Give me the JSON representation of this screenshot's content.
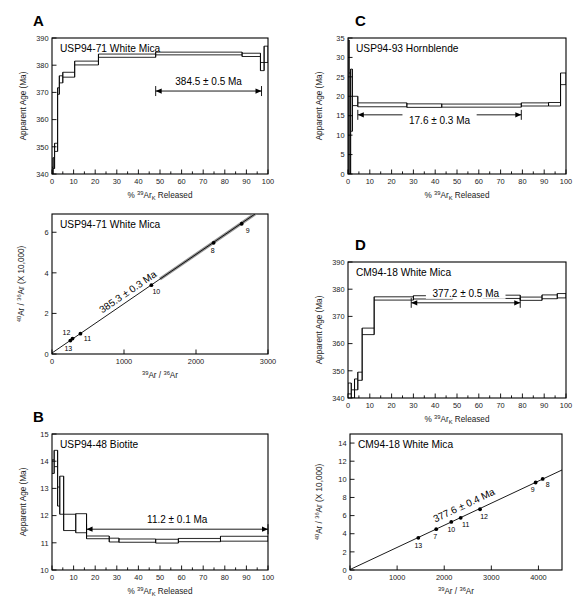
{
  "figure": {
    "panels": [
      "A",
      "B",
      "C",
      "D"
    ]
  },
  "axis_titles": {
    "spectrum_y": "Apparent Age (Ma)",
    "spectrum_x_pre": "% ",
    "spectrum_x_sup": "39",
    "spectrum_x_el": "Ar",
    "spectrum_x_sub": "K",
    "spectrum_x_post": " Released",
    "isochron_y_sup1": "40",
    "isochron_y_el1": "Ar",
    "isochron_y_slash": " / ",
    "isochron_y_sup2": "36",
    "isochron_y_el2": "Ar",
    "isochron_y_mult": " (X 10,000)",
    "isochron_x_sup1": "39",
    "isochron_x_el1": "Ar",
    "isochron_x_slash": " / ",
    "isochron_x_sup2": "36",
    "isochron_x_el2": "Ar"
  },
  "chart_data": [
    {
      "id": "panel-a-spectrum",
      "panel": "A",
      "type": "area",
      "title": "USP94-71   White Mica",
      "sample": "USP94-71",
      "mineral": "White Mica",
      "xlabel": "% 39ArK Released",
      "ylabel": "Apparent Age (Ma)",
      "xlim": [
        0,
        100
      ],
      "ylim": [
        340,
        390
      ],
      "xticks": [
        0,
        10,
        20,
        30,
        40,
        50,
        60,
        70,
        80,
        90,
        100
      ],
      "yticks": [
        340,
        350,
        360,
        370,
        380,
        390
      ],
      "grid": false,
      "plateau_label": "384.5 ± 0.5 Ma",
      "plateau_range": [
        48,
        97
      ],
      "plateau_age": 384.5,
      "plateau_error": 0.5,
      "steps": [
        {
          "x0": 0.0,
          "x1": 0.5,
          "age": 340.5,
          "err": 2.0
        },
        {
          "x0": 0.5,
          "x1": 1.2,
          "age": 344.0,
          "err": 2.0
        },
        {
          "x0": 1.2,
          "x1": 2.6,
          "age": 349.8,
          "err": 1.5
        },
        {
          "x0": 2.6,
          "x1": 3.4,
          "age": 370.5,
          "err": 1.2
        },
        {
          "x0": 3.4,
          "x1": 5.0,
          "age": 374.8,
          "err": 1.3
        },
        {
          "x0": 5.0,
          "x1": 10.5,
          "age": 376.5,
          "err": 0.9
        },
        {
          "x0": 10.5,
          "x1": 21.5,
          "age": 380.8,
          "err": 0.7
        },
        {
          "x0": 21.5,
          "x1": 48.0,
          "age": 383.5,
          "err": 0.6
        },
        {
          "x0": 48.0,
          "x1": 88.0,
          "age": 384.3,
          "err": 0.5
        },
        {
          "x0": 88.0,
          "x1": 96.5,
          "age": 383.8,
          "err": 0.6
        },
        {
          "x0": 96.5,
          "x1": 98.2,
          "age": 379.5,
          "err": 1.5
        },
        {
          "x0": 98.2,
          "x1": 100.0,
          "age": 384.0,
          "err": 3.0
        }
      ]
    },
    {
      "id": "panel-a-isochron",
      "panel": "A",
      "type": "scatter",
      "title": "USP94-71 White Mica",
      "sample": "USP94-71",
      "mineral": "White Mica",
      "xlabel": "39Ar / 36Ar",
      "ylabel": "40Ar / 36Ar (X 10,000)",
      "xlim": [
        0,
        3000
      ],
      "ylim": [
        0,
        6.9
      ],
      "xticks": [
        0,
        1000,
        2000,
        3000
      ],
      "yticks": [
        0,
        2,
        4,
        6
      ],
      "grid": false,
      "age_label": "385.3 ± 0.3 Ma",
      "age": 385.3,
      "age_error": 0.3,
      "intercept": 0.05,
      "slope_per_1000": 2.43,
      "points": [
        {
          "label": "13",
          "x": 255,
          "y": 0.66
        },
        {
          "label": "12",
          "x": 285,
          "y": 0.76
        },
        {
          "label": "11",
          "x": 395,
          "y": 1.0
        },
        {
          "label": "10",
          "x": 1380,
          "y": 3.39
        },
        {
          "label": "8",
          "x": 2245,
          "y": 5.48
        },
        {
          "label": "9",
          "x": 2635,
          "y": 6.42
        }
      ]
    },
    {
      "id": "panel-b-spectrum",
      "panel": "B",
      "type": "area",
      "title": "USP94-48   Biotite",
      "sample": "USP94-48",
      "mineral": "Biotite",
      "xlabel": "% 39ArK Released",
      "ylabel": "Apparent Age (Ma)",
      "xlim": [
        0,
        100
      ],
      "ylim": [
        10,
        15
      ],
      "xticks": [
        0,
        10,
        20,
        30,
        40,
        50,
        60,
        70,
        80,
        90,
        100
      ],
      "yticks": [
        10,
        11,
        12,
        13,
        14,
        15
      ],
      "grid": false,
      "plateau_label": "11.2 ± 0.1 Ma",
      "plateau_range": [
        16,
        100
      ],
      "plateau_age": 11.2,
      "plateau_error": 0.1,
      "steps": [
        {
          "x0": 0.0,
          "x1": 1.0,
          "age": 13.8,
          "err": 0.25
        },
        {
          "x0": 1.0,
          "x1": 2.6,
          "age": 14.1,
          "err": 0.3
        },
        {
          "x0": 2.6,
          "x1": 3.6,
          "age": 12.7,
          "err": 0.35
        },
        {
          "x0": 3.6,
          "x1": 5.4,
          "age": 12.75,
          "err": 0.7
        },
        {
          "x0": 5.4,
          "x1": 11.0,
          "age": 11.75,
          "err": 0.3
        },
        {
          "x0": 11.0,
          "x1": 16.0,
          "age": 11.72,
          "err": 0.35
        },
        {
          "x0": 16.0,
          "x1": 26.5,
          "age": 11.2,
          "err": 0.05
        },
        {
          "x0": 26.5,
          "x1": 31.0,
          "age": 11.1,
          "err": 0.07
        },
        {
          "x0": 31.0,
          "x1": 48.0,
          "age": 11.08,
          "err": 0.06
        },
        {
          "x0": 48.0,
          "x1": 58.5,
          "age": 11.06,
          "err": 0.07
        },
        {
          "x0": 58.5,
          "x1": 78.0,
          "age": 11.1,
          "err": 0.06
        },
        {
          "x0": 78.0,
          "x1": 100.0,
          "age": 11.15,
          "err": 0.09
        }
      ]
    },
    {
      "id": "panel-c-spectrum",
      "panel": "C",
      "type": "area",
      "title": "USP94-93   Hornblende",
      "sample": "USP94-93",
      "mineral": "Hornblende",
      "xlabel": "% 39ArK Released",
      "ylabel": "Apparent Age (Ma)",
      "xlim": [
        0,
        100
      ],
      "ylim": [
        0,
        35
      ],
      "xticks": [
        0,
        10,
        20,
        30,
        40,
        50,
        60,
        70,
        80,
        90,
        100
      ],
      "yticks": [
        0,
        5,
        10,
        15,
        20,
        25,
        30,
        35
      ],
      "grid": false,
      "plateau_label": "17.6 ± 0.3 Ma",
      "plateau_range": [
        4.5,
        79.5
      ],
      "plateau_age": 17.6,
      "plateau_error": 0.3,
      "steps": [
        {
          "x0": 0.0,
          "x1": 0.5,
          "age": 17.0,
          "err": 17.5
        },
        {
          "x0": 0.5,
          "x1": 1.2,
          "age": 13.0,
          "err": 13.0
        },
        {
          "x0": 1.2,
          "x1": 2.0,
          "age": 19.0,
          "err": 8.0
        },
        {
          "x0": 2.0,
          "x1": 4.5,
          "age": 18.8,
          "err": 1.2
        },
        {
          "x0": 4.5,
          "x1": 27.0,
          "age": 17.8,
          "err": 0.5
        },
        {
          "x0": 27.0,
          "x1": 43.0,
          "age": 17.6,
          "err": 0.45
        },
        {
          "x0": 43.0,
          "x1": 79.5,
          "age": 17.6,
          "err": 0.4
        },
        {
          "x0": 79.5,
          "x1": 92.0,
          "age": 17.9,
          "err": 0.4
        },
        {
          "x0": 92.0,
          "x1": 97.5,
          "age": 17.95,
          "err": 0.45
        },
        {
          "x0": 97.5,
          "x1": 100.0,
          "age": 24.5,
          "err": 1.5
        }
      ]
    },
    {
      "id": "panel-d-spectrum",
      "panel": "D",
      "type": "area",
      "title": "CM94-18   White Mica",
      "sample": "CM94-18",
      "mineral": "White Mica",
      "xlabel": "% 39ArK Released",
      "ylabel": "Apparent Age (Ma)",
      "xlim": [
        0,
        100
      ],
      "ylim": [
        340,
        390
      ],
      "xticks": [
        0,
        10,
        20,
        30,
        40,
        50,
        60,
        70,
        80,
        90,
        100
      ],
      "yticks": [
        340,
        350,
        360,
        370,
        380,
        390
      ],
      "grid": false,
      "plateau_label": "377.2 ± 0.5 Ma",
      "plateau_range": [
        29,
        79
      ],
      "plateau_age": 377.2,
      "plateau_error": 0.5,
      "steps": [
        {
          "x0": 0.0,
          "x1": 1.5,
          "age": 343.5,
          "err": 2.0
        },
        {
          "x0": 1.5,
          "x1": 3.0,
          "age": 341.5,
          "err": 1.5
        },
        {
          "x0": 3.0,
          "x1": 4.5,
          "age": 345.0,
          "err": 2.0
        },
        {
          "x0": 4.5,
          "x1": 6.5,
          "age": 348.0,
          "err": 1.5
        },
        {
          "x0": 6.5,
          "x1": 12.0,
          "age": 364.5,
          "err": 1.2
        },
        {
          "x0": 12.0,
          "x1": 30.0,
          "age": 376.6,
          "err": 0.6
        },
        {
          "x0": 30.0,
          "x1": 48.0,
          "age": 377.0,
          "err": 0.6
        },
        {
          "x0": 48.0,
          "x1": 62.0,
          "age": 377.8,
          "err": 0.6
        },
        {
          "x0": 62.0,
          "x1": 79.0,
          "age": 377.2,
          "err": 0.6
        },
        {
          "x0": 79.0,
          "x1": 89.0,
          "age": 376.5,
          "err": 0.6
        },
        {
          "x0": 89.0,
          "x1": 96.0,
          "age": 377.2,
          "err": 0.7
        },
        {
          "x0": 96.0,
          "x1": 100.0,
          "age": 377.6,
          "err": 0.8
        }
      ]
    },
    {
      "id": "panel-d-isochron",
      "panel": "D",
      "type": "scatter",
      "title": "CM94-18   White Mica",
      "sample": "CM94-18",
      "mineral": "White Mica",
      "xlabel": "39Ar / 36Ar",
      "ylabel": "40Ar / 36Ar (X 10,000)",
      "xlim": [
        0,
        4500
      ],
      "ylim": [
        0,
        15
      ],
      "xticks": [
        0,
        1000,
        2000,
        3000,
        4000
      ],
      "yticks": [
        0,
        2,
        4,
        6,
        8,
        10,
        12,
        14
      ],
      "grid": false,
      "age_label": "377.6 ± 0.4 Ma",
      "age": 377.6,
      "age_error": 0.4,
      "intercept": 0.05,
      "slope_per_1000": 2.44,
      "points": [
        {
          "label": "13",
          "x": 1450,
          "y": 3.55
        },
        {
          "label": "7",
          "x": 1830,
          "y": 4.5
        },
        {
          "label": "10",
          "x": 2150,
          "y": 5.3
        },
        {
          "label": "11",
          "x": 2350,
          "y": 5.75
        },
        {
          "label": "12",
          "x": 2760,
          "y": 6.7
        },
        {
          "label": "9",
          "x": 3940,
          "y": 9.65
        },
        {
          "label": "8",
          "x": 4090,
          "y": 10.05
        }
      ]
    }
  ]
}
